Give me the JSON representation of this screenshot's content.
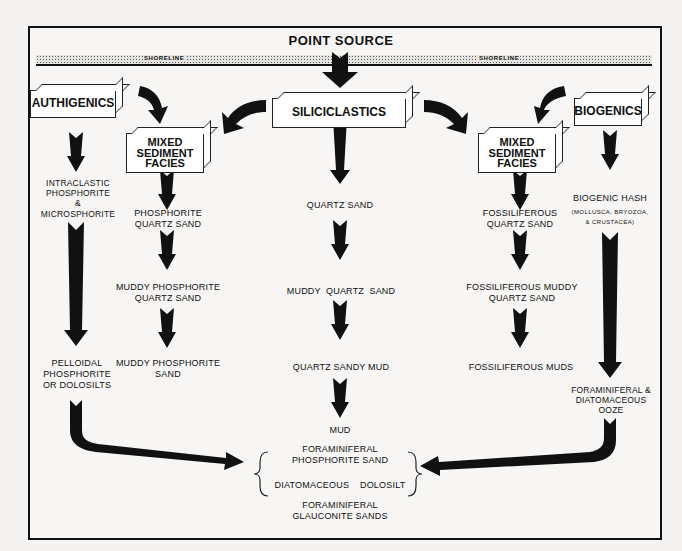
{
  "title": "POINT SOURCE",
  "shoreline": {
    "left_label": "SHORELINE",
    "right_label": "SHORELINE"
  },
  "boxes": {
    "authigenics": "AUTHIGENICS",
    "siliciclastics": "SILICICLASTICS",
    "biogenics": "BIOGENICS",
    "mixed_left": "MIXED\nSEDIMENT\nFACIES",
    "mixed_right": "MIXED\nSEDIMENT\nFACIES"
  },
  "columns": {
    "authigenics": [
      "INTRACLASTIC\nPHOSPHORITE\n&\nMICROSPHORITE",
      "PELLOIDAL\nPHOSPHORITE\nOR DOLOSILTS"
    ],
    "mixed_left": [
      "PHOSPHORITE\nQUARTZ SAND",
      "MUDDY PHOSPHORITE\nQUARTZ SAND",
      "MUDDY PHOSPHORITE\nSAND"
    ],
    "siliciclastics": [
      "QUARTZ SAND",
      "MUDDY  QUARTZ  SAND",
      "QUARTZ SANDY MUD",
      "MUD"
    ],
    "mixed_right": [
      "FOSSILIFEROUS\nQUARTZ SAND",
      "FOSSILIFEROUS MUDDY\nQUARTZ SAND",
      "FOSSILIFEROUS MUDS"
    ],
    "biogenics": [
      "BIOGENIC HASH",
      "(MOLLUSCA, BRYOZOA,\n& CRUSTACEA)",
      "FORAMINIFERAL &\nDIATOMACEOUS\nOOZE"
    ]
  },
  "sink": {
    "bracket_lines": [
      "FORAMINIFERAL\nPHOSPHORITE SAND",
      "DIATOMACEOUS    DOLOSILT"
    ],
    "footer": "FORAMINIFERAL\nGLAUCONITE SANDS"
  }
}
